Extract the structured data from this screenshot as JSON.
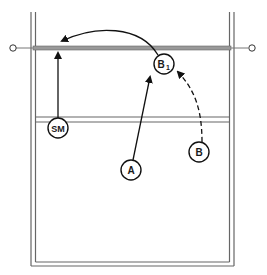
{
  "diagram": {
    "type": "volleyball-court-play",
    "colors": {
      "line": "#555555",
      "net": "#888888",
      "ink": "#111111",
      "background": "#ffffff"
    },
    "players": [
      {
        "id": "SM",
        "label": "SM",
        "subscript": "",
        "x": 58,
        "y": 128
      },
      {
        "id": "B1",
        "label": "B",
        "subscript": "1",
        "x": 164,
        "y": 64
      },
      {
        "id": "A",
        "label": "A",
        "subscript": "",
        "x": 131,
        "y": 170
      },
      {
        "id": "B",
        "label": "B",
        "subscript": "",
        "x": 199,
        "y": 152
      }
    ],
    "arrows": [
      {
        "from": "SM",
        "to": "net",
        "style": "solid",
        "kind": "straight"
      },
      {
        "from": "B1",
        "to": "net-left",
        "style": "solid",
        "kind": "curve"
      },
      {
        "from": "A",
        "to": "B1",
        "style": "solid",
        "kind": "straight"
      },
      {
        "from": "B",
        "to": "B1",
        "style": "dashed",
        "kind": "curve"
      }
    ]
  }
}
